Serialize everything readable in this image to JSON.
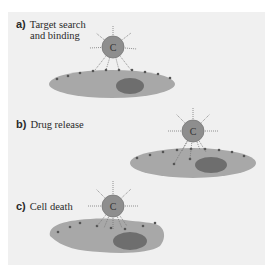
{
  "figure": {
    "panels": [
      {
        "letter": "a)",
        "title_line1": "Target search",
        "title_line2": "and binding"
      },
      {
        "letter": "b)",
        "title_line1": "Drug release"
      },
      {
        "letter": "c)",
        "title_line1": "Cell death"
      }
    ],
    "carrier_label": "C",
    "colors": {
      "background": "#f0f0f0",
      "cell": "#a8a8a8",
      "nucleus": "#6e6e6e",
      "carrier": "#8e8e8e",
      "receptor": "#555555"
    }
  }
}
